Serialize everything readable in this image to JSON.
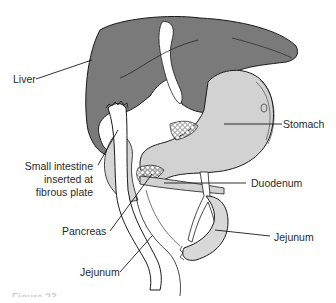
{
  "figure": {
    "caption": "Figure 23-",
    "colors": {
      "liver": "#7a7a7a",
      "stomach": "#d2d2d2",
      "intestine": "#e2e2e2",
      "outline": "#1a1a1a",
      "background": "#ffffff"
    },
    "labels": {
      "liver": "Liver",
      "stomach": "Stomach",
      "small_intestine_line1": "Small intestine",
      "small_intestine_line2": "inserted at",
      "small_intestine_line3": "fibrous plate",
      "duodenum": "Duodenum",
      "pancreas": "Pancreas",
      "jejunum_right": "Jejunum",
      "jejunum_left": "Jejunum"
    }
  }
}
